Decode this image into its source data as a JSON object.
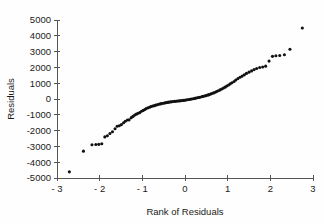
{
  "chart_data": {
    "type": "scatter",
    "title": "",
    "xlabel": "Rank of Residuals",
    "ylabel": "Residuals",
    "xlim": [
      -3,
      3
    ],
    "ylim": [
      -5000,
      5000
    ],
    "xticks": [
      -3,
      -2,
      -1,
      0,
      1,
      2,
      3
    ],
    "xtick_labels": [
      "- 3",
      "- 2",
      "- 1",
      "0",
      "1",
      "2",
      "3"
    ],
    "yticks": [
      5000,
      4000,
      3000,
      2000,
      1000,
      0,
      -1000,
      -2000,
      -3000,
      -4000,
      -5000
    ],
    "ytick_labels": [
      "5000",
      "4000",
      "3000",
      "2000",
      "1000",
      "0",
      "-1000",
      "-2000",
      "-3000",
      "-4000",
      "-5000"
    ],
    "grid": false,
    "legend": null,
    "marker": "filled-circle",
    "marker_color": "#111111",
    "marker_size": 3.1,
    "points": [
      [
        -2.71,
        -4610
      ],
      [
        -2.38,
        -3300
      ],
      [
        -2.18,
        -2900
      ],
      [
        -2.09,
        -2880
      ],
      [
        -2.02,
        -2870
      ],
      [
        -1.95,
        -2830
      ],
      [
        -1.88,
        -2400
      ],
      [
        -1.82,
        -2330
      ],
      [
        -1.76,
        -2180
      ],
      [
        -1.7,
        -2070
      ],
      [
        -1.64,
        -1880
      ],
      [
        -1.59,
        -1720
      ],
      [
        -1.54,
        -1690
      ],
      [
        -1.49,
        -1620
      ],
      [
        -1.44,
        -1500
      ],
      [
        -1.4,
        -1410
      ],
      [
        -1.35,
        -1330
      ],
      [
        -1.31,
        -1320
      ],
      [
        -1.26,
        -1180
      ],
      [
        -1.22,
        -1100
      ],
      [
        -1.18,
        -1020
      ],
      [
        -1.14,
        -960
      ],
      [
        -1.1,
        -900
      ],
      [
        -1.06,
        -860
      ],
      [
        -1.02,
        -780
      ],
      [
        -0.98,
        -720
      ],
      [
        -0.94,
        -660
      ],
      [
        -0.91,
        -600
      ],
      [
        -0.87,
        -560
      ],
      [
        -0.83,
        -520
      ],
      [
        -0.8,
        -480
      ],
      [
        -0.76,
        -450
      ],
      [
        -0.72,
        -420
      ],
      [
        -0.69,
        -390
      ],
      [
        -0.65,
        -360
      ],
      [
        -0.62,
        -330
      ],
      [
        -0.58,
        -310
      ],
      [
        -0.55,
        -290
      ],
      [
        -0.51,
        -270
      ],
      [
        -0.48,
        -250
      ],
      [
        -0.45,
        -230
      ],
      [
        -0.41,
        -215
      ],
      [
        -0.38,
        -200
      ],
      [
        -0.34,
        -185
      ],
      [
        -0.31,
        -170
      ],
      [
        -0.28,
        -160
      ],
      [
        -0.24,
        -150
      ],
      [
        -0.21,
        -140
      ],
      [
        -0.18,
        -130
      ],
      [
        -0.14,
        -120
      ],
      [
        -0.11,
        -110
      ],
      [
        -0.08,
        -100
      ],
      [
        -0.04,
        -90
      ],
      [
        -0.01,
        -80
      ],
      [
        0.02,
        -60
      ],
      [
        0.05,
        -45
      ],
      [
        0.09,
        -30
      ],
      [
        0.12,
        -15
      ],
      [
        0.15,
        0
      ],
      [
        0.19,
        15
      ],
      [
        0.22,
        35
      ],
      [
        0.25,
        55
      ],
      [
        0.29,
        75
      ],
      [
        0.32,
        95
      ],
      [
        0.35,
        115
      ],
      [
        0.39,
        140
      ],
      [
        0.42,
        165
      ],
      [
        0.46,
        190
      ],
      [
        0.49,
        215
      ],
      [
        0.53,
        245
      ],
      [
        0.56,
        275
      ],
      [
        0.6,
        310
      ],
      [
        0.63,
        345
      ],
      [
        0.67,
        385
      ],
      [
        0.71,
        430
      ],
      [
        0.74,
        470
      ],
      [
        0.78,
        520
      ],
      [
        0.82,
        575
      ],
      [
        0.86,
        630
      ],
      [
        0.9,
        690
      ],
      [
        0.94,
        750
      ],
      [
        0.98,
        820
      ],
      [
        1.02,
        890
      ],
      [
        1.06,
        960
      ],
      [
        1.1,
        1030
      ],
      [
        1.15,
        1110
      ],
      [
        1.19,
        1200
      ],
      [
        1.24,
        1290
      ],
      [
        1.29,
        1380
      ],
      [
        1.34,
        1450
      ],
      [
        1.39,
        1530
      ],
      [
        1.44,
        1620
      ],
      [
        1.5,
        1700
      ],
      [
        1.56,
        1780
      ],
      [
        1.62,
        1860
      ],
      [
        1.68,
        1930
      ],
      [
        1.75,
        1990
      ],
      [
        1.82,
        2030
      ],
      [
        1.89,
        2080
      ],
      [
        1.97,
        2400
      ],
      [
        2.05,
        2700
      ],
      [
        2.13,
        2740
      ],
      [
        2.22,
        2750
      ],
      [
        2.33,
        2800
      ],
      [
        2.46,
        3150
      ],
      [
        2.75,
        4490
      ]
    ]
  },
  "axes": {
    "x_axis_name": "x-axis",
    "y_axis_name": "y-axis"
  }
}
